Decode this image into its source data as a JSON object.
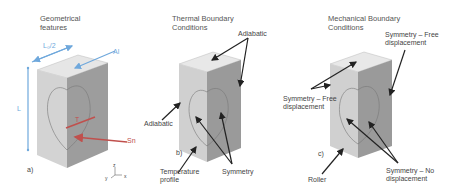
{
  "panels": [
    {
      "id": "a",
      "title": "Geometrical\nfeatures",
      "panel_label": "a)",
      "dimension_labels": {
        "half_width": "L₀/2",
        "area": "Al",
        "length": "L",
        "inner": "T",
        "surface": "Sn"
      },
      "axes": {
        "z": "z",
        "x": "x",
        "y": "y"
      }
    },
    {
      "id": "b",
      "title": "Thermal Boundary\nConditions",
      "panel_label": "b)",
      "annotations": [
        "Adiabatic",
        "Adiabatic",
        "Temperature\nprofile",
        "Symmetry"
      ]
    },
    {
      "id": "c",
      "title": "Mechanical Boundary\nConditions",
      "panel_label": "c)",
      "annotations": [
        "Symmetry – Free\ndisplacement",
        "Symmetry – Free\ndisplacement",
        "Roller",
        "Symmetry – No\ndisplacement"
      ]
    }
  ],
  "colors": {
    "accent_blue": "#6fa8dc",
    "accent_red": "#c0504d",
    "arrow": "#222222"
  }
}
